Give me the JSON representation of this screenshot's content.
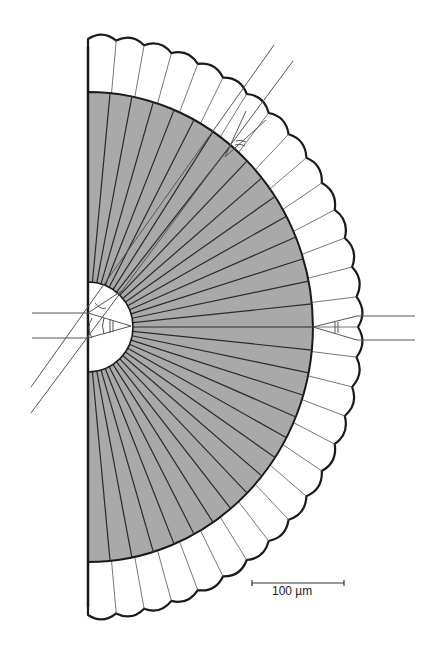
{
  "figure": {
    "colors": {
      "background": "#ffffff",
      "shaded_region": "#a9a9a9",
      "outline": "#1a1a1a",
      "rays": "#2a2a2a",
      "thin_lines": "#555555"
    },
    "geometry": {
      "center_x": 88,
      "center_y": 327,
      "inner_radius": 45,
      "shaded_radius_x": 225,
      "shaded_radius_y": 235,
      "outer_radius_x": 270,
      "outer_radius_y": 288,
      "segments": 30
    }
  },
  "scale_bar": {
    "label": "100 µm",
    "x1": 252,
    "x2": 344,
    "y": 583
  }
}
